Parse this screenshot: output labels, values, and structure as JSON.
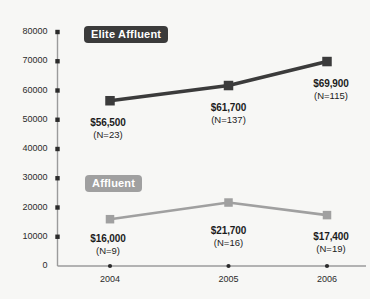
{
  "chart_data": {
    "type": "line",
    "title": "",
    "xlabel": "",
    "ylabel": "",
    "categories": [
      "2004",
      "2005",
      "2006"
    ],
    "ylim": [
      0,
      80000
    ],
    "yticks": [
      "0",
      "10000",
      "20000",
      "30000",
      "40000",
      "50000",
      "60000",
      "70000",
      "80000"
    ],
    "grid": false,
    "legend_position": "inline-badges",
    "series": [
      {
        "name": "Elite Affluent",
        "color": "#3b3b3b",
        "values": [
          56500,
          61700,
          69900
        ],
        "point_labels": [
          {
            "value": "$56,500",
            "n": "(N=23)"
          },
          {
            "value": "$61,700",
            "n": "(N=137)"
          },
          {
            "value": "$69,900",
            "n": "(N=115)"
          }
        ]
      },
      {
        "name": "Affluent",
        "color": "#a0a0a0",
        "values": [
          16000,
          21700,
          17400
        ],
        "point_labels": [
          {
            "value": "$16,000",
            "n": "(N=9)"
          },
          {
            "value": "$21,700",
            "n": "(N=16)"
          },
          {
            "value": "$17,400",
            "n": "(N=19)"
          }
        ]
      }
    ]
  },
  "colors": {
    "background": "#f7f7f5",
    "axis": "#9b9b9b",
    "tick_mark": "#2b2b2b",
    "elite": "#3b3b3b",
    "affluent": "#a0a0a0",
    "label_text": "#1c1c1c"
  }
}
